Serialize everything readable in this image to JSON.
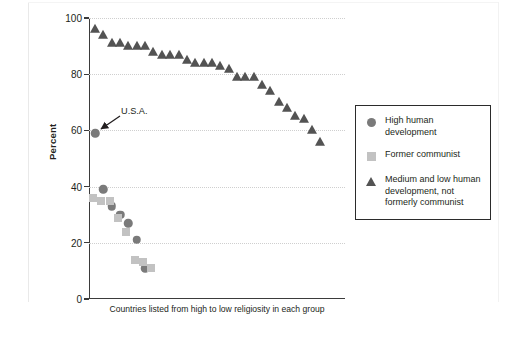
{
  "chart_data": {
    "type": "scatter",
    "title": "",
    "xlabel": "Countries listed from high to low religiosity in each group",
    "ylabel": "Percent",
    "ylim": [
      0,
      100
    ],
    "yticks": [
      0,
      20,
      40,
      60,
      80,
      100
    ],
    "ytick_labels": [
      "0",
      "20",
      "40",
      "60",
      "80",
      "100"
    ],
    "xaxis_ticks": false,
    "grid": "horizontal dotted gridlines at 20, 40, 60, 80, 100",
    "legend_position": "right, boxed",
    "annotations": [
      {
        "text": "U.S.A.",
        "points_to_series": "High human development",
        "points_to_value": 59
      }
    ],
    "series": [
      {
        "name": "High human development",
        "marker": "circle",
        "color": "#7a7a7a",
        "x": [
          1,
          2,
          3,
          4,
          5,
          6,
          7
        ],
        "values": [
          59,
          39,
          33,
          30,
          27,
          21,
          11
        ]
      },
      {
        "name": "Former communist",
        "marker": "square",
        "color": "#c2c2c2",
        "x": [
          1,
          2,
          3,
          4,
          5,
          6,
          7,
          8
        ],
        "values": [
          36,
          35,
          35,
          29,
          24,
          14,
          13,
          11
        ]
      },
      {
        "name": "Medium and low human development, not formerly communist",
        "marker": "triangle",
        "color": "#535353",
        "x": [
          1,
          2,
          3,
          4,
          5,
          6,
          7,
          8,
          9,
          10,
          11,
          12,
          13,
          14,
          15,
          16,
          17,
          18,
          19,
          20,
          21,
          22,
          23,
          24,
          25,
          26,
          27,
          28
        ],
        "values": [
          96,
          94,
          91,
          91,
          90,
          90,
          90,
          88,
          87,
          87,
          87,
          85,
          84,
          84,
          84,
          83,
          82,
          79,
          79,
          79,
          76,
          74,
          70,
          68,
          65,
          64,
          60,
          56
        ]
      }
    ]
  },
  "legend": {
    "items": [
      {
        "marker": "circle",
        "label": "High human development"
      },
      {
        "marker": "square",
        "label": "Former communist"
      },
      {
        "marker": "triangle",
        "label": "Medium and low human development, not formerly communist"
      }
    ]
  },
  "axis": {
    "y_label": "Percent",
    "x_caption": "Countries listed from high to low religiosity in each group",
    "y_tick_labels": [
      "100",
      "80",
      "60",
      "40",
      "20",
      "0"
    ]
  },
  "annotation": {
    "usa_label": "U.S.A."
  },
  "colors": {
    "circle": "#7a7a7a",
    "square": "#c2c2c2",
    "triangle": "#535353",
    "axis": "#3b3b3b",
    "grid": "#cfcfcf",
    "text": "#231f20"
  }
}
